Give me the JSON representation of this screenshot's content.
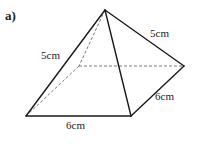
{
  "figure": {
    "part_label": "a)",
    "shape": "square-based pyramid",
    "colors": {
      "edge": "#1a1a1a",
      "hidden_edge": "#555555",
      "text": "#222222",
      "background": "#ffffff"
    },
    "vertices": {
      "apex": [
        105,
        10
      ],
      "front_left": [
        26,
        116
      ],
      "front_right": [
        131,
        116
      ],
      "back_right": [
        184,
        66
      ],
      "back_left": [
        79,
        66
      ]
    },
    "labels": {
      "slant_left": "5cm",
      "slant_right": "5cm",
      "base_right": "6cm",
      "base_front": "6cm"
    }
  }
}
